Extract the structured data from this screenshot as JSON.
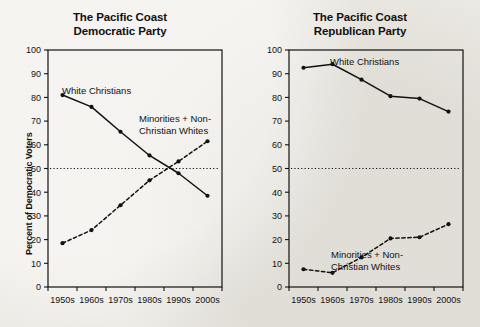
{
  "figure": {
    "background_color": "#eceae4",
    "ink_color": "#111111"
  },
  "panels": [
    {
      "name": "democratic",
      "title_line1": "The Pacific Coast",
      "title_line2": "Democratic Party",
      "ylabel": "Percent of Democratic Voters",
      "annotations": {
        "solid_label": "White Christians",
        "dashed_label_line1": "Minorities + Non-",
        "dashed_label_line2": "Christian Whites"
      }
    },
    {
      "name": "republican",
      "title_line1": "The Pacific Coast",
      "title_line2": "Republican Party",
      "ylabel": "Percent of Republican Voters",
      "annotations": {
        "solid_label": "White Christians",
        "dashed_label_line1": "Minorities + Non-",
        "dashed_label_line2": "Christian Whites"
      }
    }
  ],
  "chart_data": [
    {
      "type": "line",
      "title": "The Pacific Coast Democratic Party",
      "xlabel": "",
      "ylabel": "Percent of Democratic Voters",
      "categories": [
        "1950s",
        "1960s",
        "1970s",
        "1980s",
        "1990s",
        "2000s"
      ],
      "ylim": [
        0,
        100
      ],
      "yticks": [
        0,
        10,
        20,
        30,
        40,
        50,
        60,
        70,
        80,
        90,
        100
      ],
      "grid": false,
      "legend": "inline-annotations",
      "reference_line": {
        "value": 50,
        "style": "dotted"
      },
      "series": [
        {
          "name": "White Christians",
          "style": "solid",
          "marker": "circle",
          "values": [
            81,
            76,
            65.5,
            55.5,
            48,
            38.5
          ]
        },
        {
          "name": "Minorities + Non-Christian Whites",
          "style": "dashed",
          "marker": "circle",
          "values": [
            18.5,
            24,
            34.5,
            45,
            53,
            61.5
          ]
        }
      ]
    },
    {
      "type": "line",
      "title": "The Pacific Coast Republican Party",
      "xlabel": "",
      "ylabel": "Percent of Republican Voters",
      "categories": [
        "1950s",
        "1960s",
        "1970s",
        "1980s",
        "1990s",
        "2000s"
      ],
      "ylim": [
        0,
        100
      ],
      "yticks": [
        0,
        10,
        20,
        30,
        40,
        50,
        60,
        70,
        80,
        90,
        100
      ],
      "grid": false,
      "legend": "inline-annotations",
      "reference_line": {
        "value": 50,
        "style": "dotted"
      },
      "series": [
        {
          "name": "White Christians",
          "style": "solid",
          "marker": "circle",
          "values": [
            92.5,
            94,
            87.5,
            80.5,
            79.5,
            74
          ]
        },
        {
          "name": "Minorities + Non-Christian Whites",
          "style": "dashed",
          "marker": "circle",
          "values": [
            7.5,
            6,
            12.5,
            20.5,
            21,
            26.5
          ]
        }
      ]
    }
  ]
}
